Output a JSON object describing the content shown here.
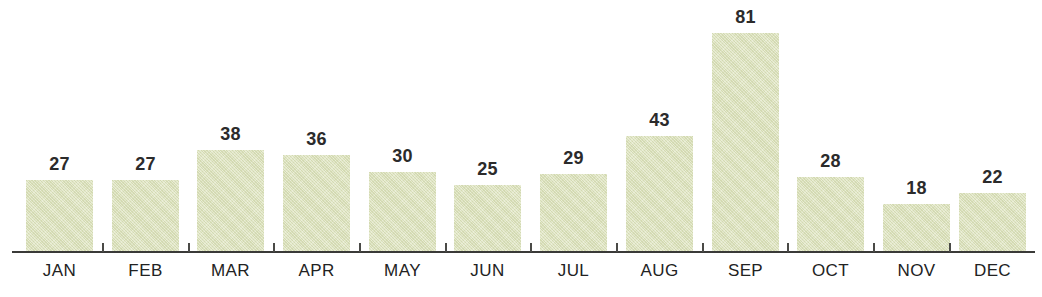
{
  "chart_data": {
    "type": "bar",
    "title": "",
    "subtitle": "",
    "xlabel": "",
    "ylabel": "",
    "categories": [
      "JAN",
      "FEB",
      "MAR",
      "APR",
      "MAY",
      "JUN",
      "JUL",
      "AUG",
      "SEP",
      "OCT",
      "NOV",
      "DEC"
    ],
    "values": [
      27,
      27,
      38,
      36,
      30,
      25,
      29,
      43,
      81,
      28,
      18,
      22
    ],
    "data_labels": [
      "27",
      "27",
      "38",
      "36",
      "30",
      "25",
      "29",
      "43",
      "81",
      "28",
      "18",
      "22"
    ],
    "ylim": [
      0,
      81
    ],
    "grid": false,
    "legend": null,
    "legend_position": "none",
    "axis": {
      "x_axis_visible": true,
      "y_axis_visible": false,
      "tick_marks_between_categories": true,
      "tick_labels_visible": false
    },
    "style": {
      "bar_fill": "#dde3bc",
      "bar_texture": "diagonal-hatch",
      "background": "#ffffff",
      "axis_color": "#3a3a38",
      "label_color": "#222222",
      "value_label_color": "#2b2b2b"
    }
  }
}
